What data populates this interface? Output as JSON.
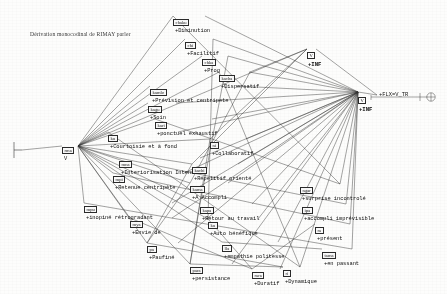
{
  "document": {
    "title": "Dérivation monocodinal de RIMAY parler",
    "kind": "semantic-derivation-graph"
  },
  "colors": {
    "ink": "#111111",
    "box_border": "#2a2a2a",
    "paper": "#fdfdfc",
    "wire": "#222222"
  },
  "root": {
    "tag": "rma",
    "feature": "V",
    "x": 62,
    "y": 138
  },
  "left_anchor": {
    "name": "bracket-anchor",
    "x": 14,
    "y": 150
  },
  "hub_right": {
    "tag": "V",
    "feature": "+INF",
    "x": 358,
    "y": 88
  },
  "hub_upper": {
    "tag": "V",
    "feature": "+INF",
    "x": 307,
    "y": 43
  },
  "terminal": {
    "feature": "+FLX=V_TR",
    "x": 377,
    "y": 91,
    "has_circle_terminal": true
  },
  "nodes": [
    {
      "tag": "chaku",
      "feature": "+Diminution",
      "x": 173,
      "y": 10
    },
    {
      "tag": "chi",
      "feature": "+Facilitif",
      "x": 185,
      "y": 33
    },
    {
      "tag": "chka",
      "feature": "+Prog",
      "x": 202,
      "y": 50
    },
    {
      "tag": "kacha",
      "feature": "+Dispersatif",
      "x": 219,
      "y": 66
    },
    {
      "tag": "kamlo",
      "feature": "+Prévision et centripete",
      "x": 150,
      "y": 80
    },
    {
      "tag": "kagu",
      "feature": "+Soin",
      "x": 148,
      "y": 97
    },
    {
      "tag": "kari",
      "feature": "+ponctuel exhaustif",
      "x": 155,
      "y": 113
    },
    {
      "tag": "ku",
      "feature": "+Courtoisie et à fond",
      "x": 108,
      "y": 126
    },
    {
      "tag": "ni",
      "feature": "+Collaboratif",
      "x": 210,
      "y": 133
    },
    {
      "tag": "mna",
      "feature": "+Interiorisation Intense",
      "x": 119,
      "y": 152
    },
    {
      "tag": "kachi",
      "feature": "+Répetitif orienté",
      "x": 192,
      "y": 158
    },
    {
      "tag": "mpi",
      "feature": "+Retenue centripète",
      "x": 113,
      "y": 167
    },
    {
      "tag": "kama",
      "feature": "+A Accompli",
      "x": 190,
      "y": 177
    },
    {
      "tag": "mpu",
      "feature": "+inopiné rétrogradant",
      "x": 84,
      "y": 197
    },
    {
      "tag": "kapa",
      "feature": "+Retour au travail",
      "x": 200,
      "y": 198
    },
    {
      "tag": "mya",
      "feature": "+Envie de",
      "x": 130,
      "y": 212
    },
    {
      "tag": "ku2",
      "label": "ku",
      "feature": "+Auto bénéfique",
      "x": 208,
      "y": 213
    },
    {
      "tag": "pa",
      "feature": "+Paufiné",
      "x": 147,
      "y": 237
    },
    {
      "tag": "lla",
      "feature": "+empathie politesse",
      "x": 222,
      "y": 236
    },
    {
      "tag": "para",
      "feature": "+persistance",
      "x": 190,
      "y": 258
    },
    {
      "tag": "rara",
      "feature": "+Duratif",
      "x": 252,
      "y": 263
    },
    {
      "tag": "ri",
      "feature": "+Dynamique",
      "x": 283,
      "y": 261
    },
    {
      "tag": "ngar",
      "feature": "+surprise incontrolé",
      "x": 300,
      "y": 178
    },
    {
      "tag": "ipa",
      "feature": "+accompli imprévisible",
      "x": 302,
      "y": 198
    },
    {
      "tag": "ra",
      "feature": "+présent",
      "x": 315,
      "y": 218
    },
    {
      "tag": "tama",
      "feature": "+en passant",
      "x": 322,
      "y": 243
    }
  ],
  "legend": {
    "note": "",
    "feature_prefix": "+"
  }
}
